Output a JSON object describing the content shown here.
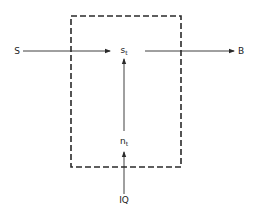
{
  "diagram": {
    "boundary": {
      "style": "dashed",
      "color": "#2a2a2a"
    },
    "nodes": {
      "S": {
        "label": "S"
      },
      "s_t": {
        "label": "s",
        "subscript": "t"
      },
      "B": {
        "label": "B"
      },
      "n_t": {
        "label": "n",
        "subscript": "t"
      },
      "IQ": {
        "label": "IQ"
      }
    },
    "edges": [
      {
        "from": "S",
        "to": "s_t"
      },
      {
        "from": "s_t",
        "to": "B"
      },
      {
        "from": "n_t",
        "to": "s_t"
      },
      {
        "from": "IQ",
        "to": "n_t"
      }
    ],
    "line_color": "#2a2a2a"
  }
}
